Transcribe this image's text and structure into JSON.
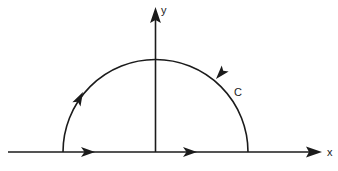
{
  "figure": {
    "name": "semicircular-contour",
    "background_color": "#ffffff",
    "stroke_color": "#1b1b1b",
    "width": 338,
    "height": 171
  },
  "axes": {
    "x_axis": {
      "label": "x",
      "label_x": 327,
      "label_y": 156,
      "line_start_x": 8,
      "line_end_x": 310,
      "line_y": 152,
      "arrow_tip_x": 322,
      "stroke_width": 1.6
    },
    "y_axis": {
      "label": "y",
      "label_x": 161,
      "label_y": 14,
      "line_x": 155.5,
      "line_start_y": 152,
      "line_end_y": 18,
      "arrow_tip_y": 7,
      "stroke_width": 1.6
    }
  },
  "contour": {
    "label": "C",
    "label_x": 234,
    "label_y": 96,
    "center_x": 155.5,
    "center_y": 152,
    "radius": 92.5,
    "left_endpoint_x": 63,
    "right_endpoint_x": 248,
    "apex_y": 59.5,
    "stroke_width": 1.6,
    "orientation": "counterclockwise"
  },
  "direction_arrows": {
    "x_axis_arrow_left": {
      "x": 90,
      "y": 152,
      "direction": "right"
    },
    "x_axis_arrow_right": {
      "x": 192,
      "y": 152,
      "direction": "right"
    },
    "arc_arrow_right": {
      "x": 216,
      "y": 79,
      "direction": "counterclockwise-up-left"
    },
    "arc_arrow_left": {
      "x": 83,
      "y": 90,
      "direction": "counterclockwise-down-left"
    }
  }
}
